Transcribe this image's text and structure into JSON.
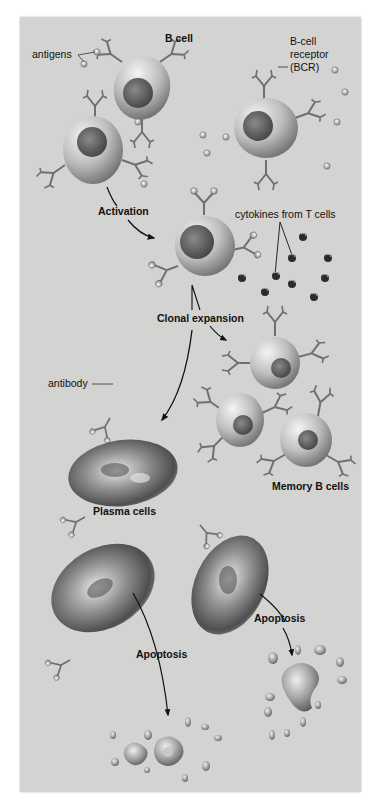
{
  "diagram": {
    "type": "B-cell activation and differentiation",
    "labels": {
      "b_cell": "B cell",
      "antigens": "antigens",
      "bcr_line1": "B-cell",
      "bcr_line2": "receptor",
      "bcr_line3": "(BCR)",
      "activation": "Activation",
      "cytokines": "cytokines from T cells",
      "clonal_expansion": "Clonal expansion",
      "antibody": "antibody",
      "memory_b_cells": "Memory B cells",
      "plasma_cells": "Plasma cells",
      "apoptosis_left": "Apoptosis",
      "apoptosis_right": "Apoptosis"
    },
    "colors": {
      "background": "#d3d3d1",
      "cell_light": "#e6e6e4",
      "cell_dark": "#6e6e6e",
      "nucleus": "#5a5a5a",
      "receptor": "#707070",
      "arrow": "#111111",
      "cytokine": "#2a2a2a"
    }
  }
}
